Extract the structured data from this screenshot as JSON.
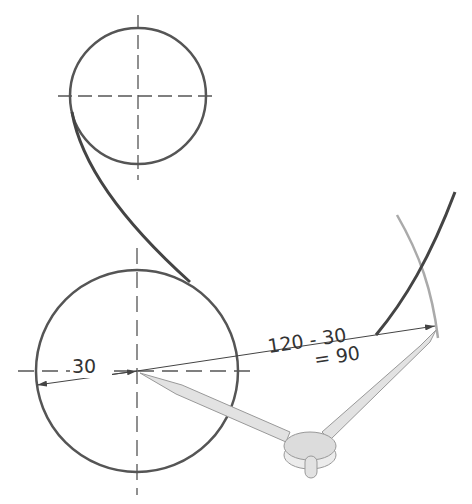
{
  "diagram": {
    "type": "compass-construction",
    "labels": {
      "radius_small": "30",
      "calc_line1": "120 - 30",
      "calc_line2": "= 90"
    },
    "elements": {
      "top_circle": {
        "cx": 138,
        "cy": 96,
        "r": 68
      },
      "bottom_circle": {
        "cx": 137,
        "cy": 371,
        "r": 101
      },
      "compass_hinge": {
        "cx": 310,
        "cy": 447
      }
    },
    "colors": {
      "line": "#555555",
      "thin": "#444444",
      "compass": "#d8d8d8",
      "arc_gray": "#aaaaaa"
    }
  }
}
